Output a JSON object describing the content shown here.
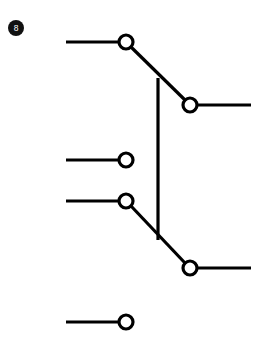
{
  "canvas": {
    "width": 266,
    "height": 343,
    "background": "#ffffff"
  },
  "badge": {
    "label": "8",
    "x": 8,
    "y": 20,
    "size": 16,
    "fill": "#111111",
    "text_color": "#ffffff",
    "font_size": 8.5
  },
  "style": {
    "stroke": "#000000",
    "line_width": 3.2,
    "node_stroke_width": 3.2,
    "node_radius": 7,
    "node_fill": "#ffffff"
  },
  "chart_data": {
    "type": "diagram",
    "title": "",
    "nodes": [
      {
        "id": "A",
        "label": "",
        "cx": 126,
        "cy": 42,
        "r": 7
      },
      {
        "id": "B",
        "label": "",
        "cx": 190,
        "cy": 105,
        "r": 7
      },
      {
        "id": "C",
        "label": "",
        "cx": 126,
        "cy": 160,
        "r": 7
      },
      {
        "id": "D",
        "label": "",
        "cx": 126,
        "cy": 201,
        "r": 7
      },
      {
        "id": "E",
        "label": "",
        "cx": 190,
        "cy": 268,
        "r": 7
      },
      {
        "id": "F",
        "label": "",
        "cx": 126,
        "cy": 322,
        "r": 7
      }
    ],
    "leads": [
      {
        "id": "lead-a",
        "x1": 66,
        "y1": 42,
        "x2": 119,
        "y2": 42,
        "node": "A",
        "side": "left"
      },
      {
        "id": "lead-b",
        "x1": 197,
        "y1": 105,
        "x2": 251,
        "y2": 105,
        "node": "B",
        "side": "right"
      },
      {
        "id": "lead-c",
        "x1": 66,
        "y1": 160,
        "x2": 119,
        "y2": 160,
        "node": "C",
        "side": "left"
      },
      {
        "id": "lead-d",
        "x1": 66,
        "y1": 201,
        "x2": 119,
        "y2": 201,
        "node": "D",
        "side": "left"
      },
      {
        "id": "lead-e",
        "x1": 197,
        "y1": 268,
        "x2": 251,
        "y2": 268,
        "node": "E",
        "side": "right"
      },
      {
        "id": "lead-f",
        "x1": 66,
        "y1": 322,
        "x2": 119,
        "y2": 322,
        "node": "F",
        "side": "left"
      }
    ],
    "connectors": [
      {
        "id": "diagonal-top",
        "from": "A",
        "to": "B",
        "x1": 131,
        "y1": 47,
        "x2": 185,
        "y2": 100
      },
      {
        "id": "diagonal-bottom",
        "from": "D",
        "to": "E",
        "x1": 131,
        "y1": 206,
        "x2": 185,
        "y2": 263
      },
      {
        "id": "vertical-link",
        "from": "diagonal-top",
        "to": "diagonal-bottom",
        "x1": 158,
        "y1": 78,
        "x2": 158,
        "y2": 240
      }
    ]
  }
}
